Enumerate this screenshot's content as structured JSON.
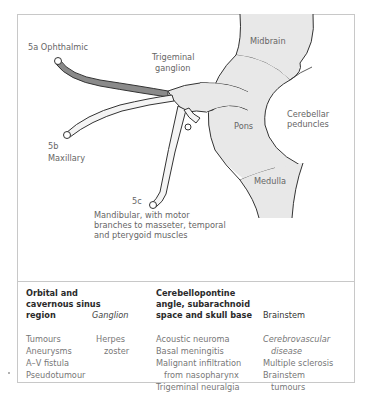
{
  "diagram": {
    "labels": {
      "ophthalmic": "5a Ophthalmic",
      "trigeminal_ganglion_1": "Trigeminal",
      "trigeminal_ganglion_2": "ganglion",
      "midbrain": "Midbrain",
      "pons": "Pons",
      "cerebellar_1": "Cerebellar",
      "cerebellar_2": "peduncles",
      "medulla": "Medulla",
      "maxillary_num": "5b",
      "maxillary": "Maxillary",
      "mandibular_num": "5c",
      "mandibular_1": "Mandibular, with motor",
      "mandibular_2": "branches to masseter, temporal",
      "mandibular_3": "and pterygoid muscles"
    },
    "colors": {
      "brainstem_fill": "#e8e8e8",
      "ophthalmic_fill": "#8a8a8a",
      "outline": "#333333"
    }
  },
  "table": {
    "columns": [
      {
        "header": [
          "Orbital and",
          "cavernous sinus",
          "region"
        ],
        "rows": [
          "Tumours",
          "Aneurysms",
          "A–V fistula",
          "Pseudotumour"
        ]
      },
      {
        "header": [
          "Ganglion"
        ],
        "rows": [
          "Herpes",
          "zoster"
        ]
      },
      {
        "header": [
          "Cerebellopontine",
          "angle, subarachnoid",
          "space and skull base"
        ],
        "rows": [
          "Acoustic neuroma",
          "Basal meningitis",
          "Malignant infiltration",
          "from nasopharynx",
          "Trigeminal neuralgia"
        ]
      },
      {
        "header": [
          "Brainstem"
        ],
        "rows": [
          "Cerebrovascular",
          "disease",
          "Multiple sclerosis",
          "Brainstem",
          "tumours"
        ]
      }
    ]
  }
}
